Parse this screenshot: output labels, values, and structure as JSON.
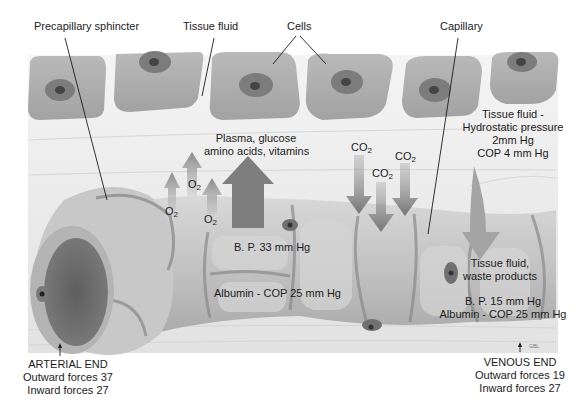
{
  "diagram": {
    "style": "grayscale medical illustration",
    "colors": {
      "background": "#ffffff",
      "tissue_fluid": "#ececec",
      "cell_body": "#a9a9a9",
      "cell_nucleus": "#7a7a7a",
      "capillary_wall": "#c4c4c4",
      "capillary_lumen": "#6e6e6e",
      "arrow_out": "#8e8e8e",
      "arrow_in": "#7c7c7c",
      "text": "#1c1c1c"
    }
  },
  "labels": {
    "precapillary_sphincter": "Precapillary sphincter",
    "tissue_fluid": "Tissue fluid",
    "cells": "Cells",
    "capillary": "Capillary",
    "plasma_line1": "Plasma, glucose",
    "plasma_line2": "amino acids, vitamins",
    "o2_a": "O",
    "o2_b": "O",
    "o2_c": "O",
    "o2_sub": "2",
    "co2_a": "CO",
    "co2_b": "CO",
    "co2_c": "CO",
    "co2_sub": "2",
    "tissue_pressure_line1": "Tissue fluid -",
    "tissue_pressure_line2": "Hydrostatic pressure",
    "tissue_pressure_line3": "2mm Hg",
    "tissue_pressure_line4": "COP 4 mm Hg",
    "arterial_bp": "B. P. 33 mm Hg",
    "arterial_albumin": "Albumin - COP 25 mm Hg",
    "waste_line1": "Tissue fluid,",
    "waste_line2": "waste products",
    "venous_bp": "B. P. 15 mm Hg",
    "venous_albumin": "Albumin - COP 25 mm Hg",
    "arterial_end": {
      "title": "ARTERIAL END",
      "outward": "Outward forces 37",
      "inward": "Inward forces 27"
    },
    "venous_end": {
      "title": "VENOUS END",
      "outward": "Outward forces 19",
      "inward": "Inward forces 27"
    },
    "signature": "GBL"
  }
}
